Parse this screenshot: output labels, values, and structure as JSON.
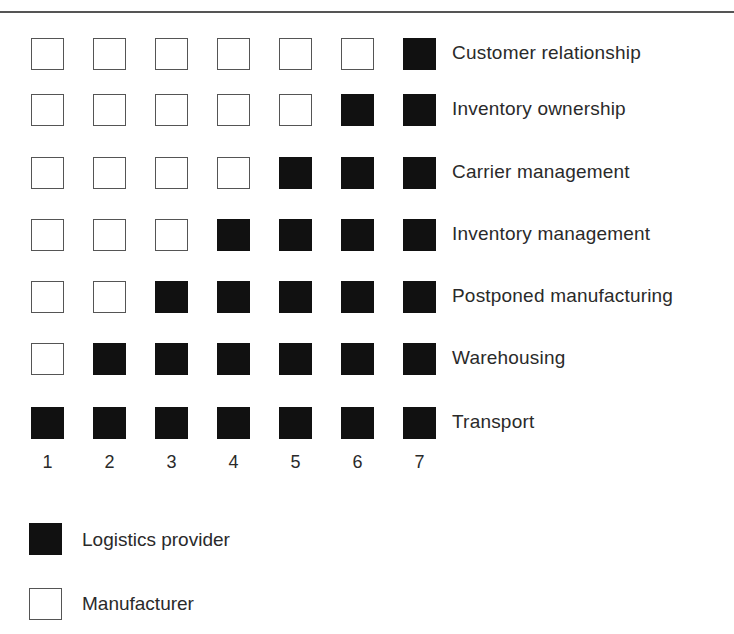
{
  "chart_data": {
    "type": "table",
    "title": "",
    "columns": [
      "1",
      "2",
      "3",
      "4",
      "5",
      "6",
      "7"
    ],
    "rows": [
      {
        "label": "Customer relationship",
        "cells": [
          0,
          0,
          0,
          0,
          0,
          0,
          1
        ]
      },
      {
        "label": "Inventory ownership",
        "cells": [
          0,
          0,
          0,
          0,
          0,
          1,
          1
        ]
      },
      {
        "label": "Carrier management",
        "cells": [
          0,
          0,
          0,
          0,
          1,
          1,
          1
        ]
      },
      {
        "label": "Inventory management",
        "cells": [
          0,
          0,
          0,
          1,
          1,
          1,
          1
        ]
      },
      {
        "label": "Postponed manufacturing",
        "cells": [
          0,
          0,
          1,
          1,
          1,
          1,
          1
        ]
      },
      {
        "label": "Warehousing",
        "cells": [
          0,
          1,
          1,
          1,
          1,
          1,
          1
        ]
      },
      {
        "label": "Transport",
        "cells": [
          1,
          1,
          1,
          1,
          1,
          1,
          1
        ]
      }
    ],
    "legend": [
      {
        "label": "Logistics provider",
        "value": 1,
        "color": "#111111"
      },
      {
        "label": "Manufacturer",
        "value": 0,
        "color": "#ffffff"
      }
    ]
  },
  "legend": {
    "provider_label": "Logistics provider",
    "manufacturer_label": "Manufacturer"
  },
  "colors": {
    "filled": "#111111",
    "empty_border": "#555555"
  }
}
